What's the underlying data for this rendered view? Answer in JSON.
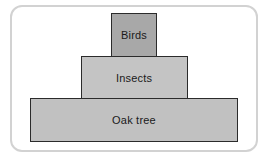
{
  "diagram": {
    "type": "ecological-pyramid",
    "title": "",
    "levels": [
      {
        "label": "Birds",
        "trophic_rank": 3,
        "width_px": 46,
        "fill": "#a8a8a8"
      },
      {
        "label": "Insects",
        "trophic_rank": 2,
        "width_px": 107,
        "fill": "#c4c4c4"
      },
      {
        "label": "Oak tree",
        "trophic_rank": 1,
        "width_px": 208,
        "fill": "#c1c1c1"
      }
    ],
    "colors": {
      "box_border": "#2b2b2b",
      "frame_border": "#d2d2d2",
      "background": "#ffffff",
      "text": "#1a1a1a"
    }
  }
}
